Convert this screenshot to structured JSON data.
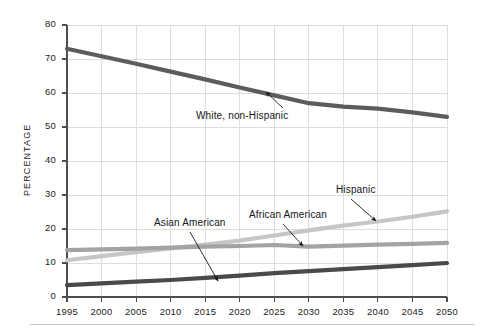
{
  "chart_data": {
    "type": "line",
    "title": "",
    "xlabel": "",
    "ylabel": "PERCENTAGE",
    "x": [
      1995,
      2000,
      2005,
      2010,
      2015,
      2020,
      2025,
      2030,
      2035,
      2040,
      2045,
      2050
    ],
    "xlim": [
      1995,
      2050
    ],
    "ylim": [
      0,
      80
    ],
    "xticks": [
      "1995",
      "2000",
      "2005",
      "2010",
      "2015",
      "2020",
      "2025",
      "2030",
      "2035",
      "2040",
      "2045",
      "2050"
    ],
    "yticks": [
      "0",
      "10",
      "20",
      "30",
      "40",
      "50",
      "60",
      "70",
      "80"
    ],
    "grid": true,
    "legend": "none (inline annotations with arrows)",
    "series": [
      {
        "name": "White, non-Hispanic",
        "color": "#5c5c5c",
        "values": [
          73.0,
          70.8,
          68.6,
          66.3,
          64.0,
          61.6,
          59.3,
          57.0,
          56.0,
          55.4,
          54.3,
          53.0
        ]
      },
      {
        "name": "Hispanic",
        "color": "#c6c6c6",
        "values": [
          10.8,
          12.0,
          13.2,
          14.3,
          15.4,
          16.6,
          18.1,
          19.6,
          21.0,
          22.2,
          23.6,
          25.2
        ]
      },
      {
        "name": "African American",
        "color": "#a3a3a3",
        "values": [
          13.8,
          14.0,
          14.2,
          14.5,
          14.8,
          15.0,
          15.3,
          14.8,
          15.1,
          15.4,
          15.6,
          15.9
        ]
      },
      {
        "name": "Asian American",
        "color": "#4a4a4a",
        "values": [
          3.5,
          4.0,
          4.5,
          5.0,
          5.6,
          6.3,
          7.0,
          7.6,
          8.2,
          8.8,
          9.4,
          10.0
        ]
      }
    ],
    "annotations": [
      {
        "label": "White, non-Hispanic",
        "points_to_series": "White, non-Hispanic"
      },
      {
        "label": "Asian American",
        "points_to_series": "Asian American"
      },
      {
        "label": "African American",
        "points_to_series": "African American"
      },
      {
        "label": "Hispanic",
        "points_to_series": "Hispanic"
      }
    ]
  },
  "axes": {
    "y_title": "PERCENTAGE",
    "y_ticks": [
      "80",
      "70",
      "60",
      "50",
      "40",
      "30",
      "20",
      "10",
      "0"
    ],
    "x_ticks": [
      "1995",
      "2000",
      "2005",
      "2010",
      "2015",
      "2020",
      "2025",
      "2030",
      "2035",
      "2040",
      "2045",
      "2050"
    ]
  },
  "annotations": {
    "white": "White, non-Hispanic",
    "asian": "Asian American",
    "african": "African American",
    "hispanic": "Hispanic"
  },
  "colors": {
    "white_line": "#5c5c5c",
    "hispanic_line": "#c6c6c6",
    "african_line": "#a3a3a3",
    "asian_line": "#4a4a4a",
    "grid": "#dcdcdc",
    "axis": "#4d4d4d",
    "background": "#ffffff"
  }
}
